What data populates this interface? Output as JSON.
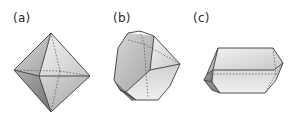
{
  "figure": {
    "panels": [
      {
        "id": "a",
        "label": "(a)",
        "shape": "octahedron"
      },
      {
        "id": "b",
        "label": "(b)",
        "shape": "truncated-polyhedron"
      },
      {
        "id": "c",
        "label": "(c)",
        "shape": "elongated-prism"
      }
    ],
    "colors": {
      "face_light": "#e6e6e6",
      "face_mid": "#c2c2c2",
      "face_dark": "#8e8e8e",
      "edge": "#3a3a3a"
    }
  }
}
